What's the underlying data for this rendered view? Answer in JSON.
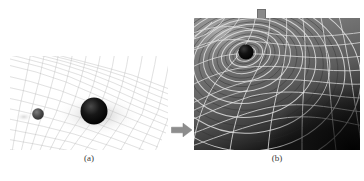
{
  "figure": {
    "background_color": "#ffffff"
  },
  "panel_a": {
    "caption": "(a)",
    "description": "flat-grid mesh with two masses",
    "mesh_color": "#b9b9b9",
    "background_color": "#ffffff",
    "bodies": [
      {
        "name": "small-sphere",
        "cx_pct": 18,
        "cy_pct": 62,
        "r_pct": 4.0,
        "color": "#3c3c3c"
      },
      {
        "name": "large-sphere",
        "cx_pct": 53,
        "cy_pct": 58,
        "r_pct": 9.5,
        "color": "#070707"
      }
    ]
  },
  "arrow": {
    "name": "right-arrow",
    "direction": "right",
    "color": "#8d8d8d"
  },
  "panel_b": {
    "caption": "(b)",
    "label_text": "引力波",
    "label_background": "#ededed",
    "label_text_color": "#121212",
    "description": "warped spacetime photo with gravitational ripples",
    "background_color": "#6d6d6d",
    "grid_color": "#e8e8e8",
    "tab_color": "#8a8a8a",
    "bodies": [
      {
        "name": "black-hole-sphere",
        "cx_pct": 31,
        "cy_pct": 26,
        "r_pct": 6.0,
        "color": "#101010"
      }
    ]
  }
}
